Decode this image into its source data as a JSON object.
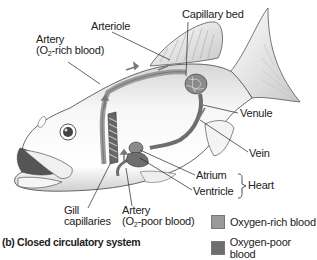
{
  "diagram": {
    "caption": "(b) Closed circulatory system",
    "labels": {
      "capillary_bed": "Capillary bed",
      "arteriole": "Arteriole",
      "artery_rich_line1": "Artery",
      "artery_rich_line2_pre": "(O",
      "artery_rich_line2_sub": "2",
      "artery_rich_line2_post": "-rich blood)",
      "venule": "Venule",
      "vein": "Vein",
      "atrium": "Atrium",
      "ventricle": "Ventricle",
      "heart": "Heart",
      "gill_line1": "Gill",
      "gill_line2": "capillaries",
      "artery_poor_line1": "Artery",
      "artery_poor_line2_pre": "(O",
      "artery_poor_line2_sub": "2",
      "artery_poor_line2_post": "-poor blood)"
    },
    "legend": [
      {
        "label": "Oxygen-rich blood",
        "color": "#9a9a9a"
      },
      {
        "label": "Oxygen-poor blood",
        "color": "#6e6e6e"
      }
    ],
    "colors": {
      "outline": "#444444",
      "fish_fill": "#f2f2f2",
      "vessel_rich": "#9a9a9a",
      "vessel_poor": "#6e6e6e",
      "leader": "#222222"
    }
  }
}
